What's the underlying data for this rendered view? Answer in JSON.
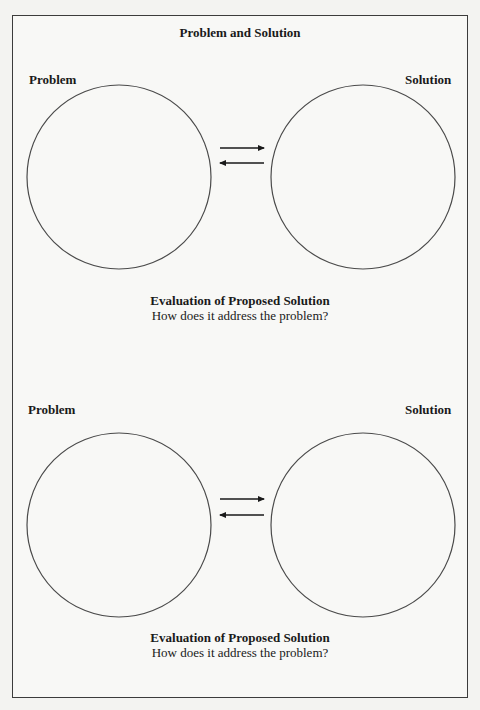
{
  "title": "Problem and Solution",
  "sections": [
    {
      "problem_label": "Problem",
      "solution_label": "Solution",
      "evaluation_heading": "Evaluation of Proposed Solution",
      "evaluation_prompt": "How does it address the problem?"
    },
    {
      "problem_label": "Problem",
      "solution_label": "Solution",
      "evaluation_heading": "Evaluation of Proposed Solution",
      "evaluation_prompt": "How does it address the problem?"
    }
  ],
  "colors": {
    "stroke": "#3c3c3c",
    "paper": "#f8f8f6"
  }
}
